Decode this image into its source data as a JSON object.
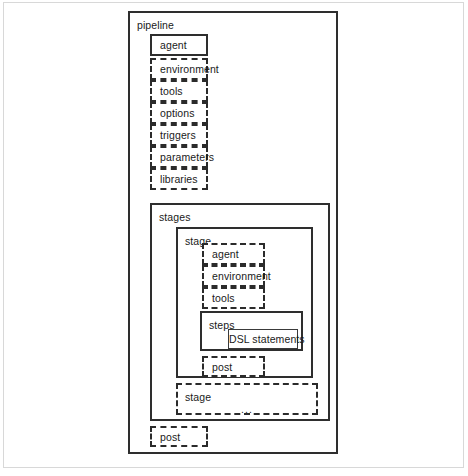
{
  "diagram": {
    "title": "pipeline",
    "type": "nested-block-diagram",
    "pipeline": {
      "label": "pipeline",
      "blocks": [
        {
          "label": "agent",
          "style": "solid"
        },
        {
          "label": "environment",
          "style": "dashed"
        },
        {
          "label": "tools",
          "style": "dashed"
        },
        {
          "label": "options",
          "style": "dashed"
        },
        {
          "label": "triggers",
          "style": "dashed"
        },
        {
          "label": "parameters",
          "style": "dashed"
        },
        {
          "label": "libraries",
          "style": "dashed"
        }
      ],
      "stages": {
        "label": "stages",
        "stage": {
          "label": "stage",
          "blocks": [
            {
              "label": "agent",
              "style": "dashed"
            },
            {
              "label": "environment",
              "style": "dashed"
            },
            {
              "label": "tools",
              "style": "dashed"
            }
          ],
          "steps": {
            "label": "steps",
            "inner": {
              "label": "DSL statements",
              "style": "solid"
            }
          },
          "post": {
            "label": "post",
            "style": "dashed"
          }
        },
        "stage_repeat": {
          "label": "stage",
          "ellipsis": "...",
          "style": "dashed"
        }
      },
      "post": {
        "label": "post",
        "style": "dashed"
      }
    }
  },
  "colors": {
    "stroke": "#2e2e2e",
    "text": "#1a1a1a",
    "background": "#ffffff",
    "frame": "#d8d8d8"
  }
}
